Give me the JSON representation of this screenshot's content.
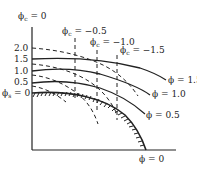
{
  "diagram": {
    "type": "phase-contour-diagram",
    "y_axis": {
      "top_label": "ϕc = 0",
      "top_label_parts": {
        "sym": "ϕ",
        "sub": "c",
        "rest": " = 0"
      },
      "tick_labels": [
        "2.0",
        "1.5",
        "1.0",
        "0.5"
      ],
      "baseline_label_parts": {
        "sym": "ϕ",
        "sub": "s",
        "rest": " = 0"
      }
    },
    "x_axis": {
      "end_label": "ϕ = 0"
    },
    "vertical_dashed_lines": [
      {
        "label_sym": "ϕ",
        "label_sub": "c",
        "label_rest": " = −0.5"
      },
      {
        "label_sym": "ϕ",
        "label_sub": "c",
        "label_rest": " = −1.0"
      },
      {
        "label_sym": "ϕ",
        "label_sub": "c",
        "label_rest": " = −1.5"
      }
    ],
    "solid_curves": [
      {
        "label": "ϕ = 1.5"
      },
      {
        "label": "ϕ = 1.0"
      },
      {
        "label": "ϕ = 0.5"
      }
    ],
    "boundary": {
      "label": "ϕ = 0",
      "style": "hatched"
    },
    "colors": {
      "line": "#222222",
      "background": "#ffffff"
    }
  }
}
